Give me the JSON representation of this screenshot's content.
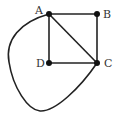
{
  "diagram": {
    "type": "graph",
    "nodes": [
      {
        "id": "A",
        "label": "A",
        "x": 49,
        "y": 14
      },
      {
        "id": "B",
        "label": "B",
        "x": 97,
        "y": 14
      },
      {
        "id": "C",
        "label": "C",
        "x": 97,
        "y": 63
      },
      {
        "id": "D",
        "label": "D",
        "x": 49,
        "y": 63
      }
    ],
    "edges": [
      {
        "from": "A",
        "to": "B",
        "style": "straight"
      },
      {
        "from": "B",
        "to": "C",
        "style": "straight"
      },
      {
        "from": "A",
        "to": "D",
        "style": "straight"
      },
      {
        "from": "D",
        "to": "C",
        "style": "straight"
      },
      {
        "from": "A",
        "to": "C",
        "style": "straight"
      },
      {
        "from": "A",
        "to": "C",
        "style": "curved-left-loop"
      }
    ],
    "colors": {
      "stroke": "#222222",
      "node": "#111111",
      "label": "#333333"
    }
  }
}
